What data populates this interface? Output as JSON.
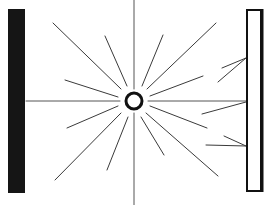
{
  "diagram": {
    "title": "",
    "colors": {
      "background": "#ffffff",
      "ray": "#3a3a3a",
      "axis": "#555555",
      "wall": "#151515",
      "panel_fill": "#ffffff",
      "panel_stroke": "#111111",
      "source": "#111111"
    },
    "source": {
      "cx": 134,
      "cy": 101,
      "r": 8
    },
    "left_wall": {
      "x": 8,
      "y": 9,
      "width": 17,
      "height": 184
    },
    "right_panel": {
      "x": 247,
      "y": 10,
      "width": 15,
      "height": 181
    },
    "axes": [
      {
        "x1": 26,
        "y1": 101,
        "x2": 120,
        "y2": 101
      },
      {
        "x1": 148,
        "y1": 101,
        "x2": 247,
        "y2": 101
      },
      {
        "x1": 134,
        "y1": 0,
        "x2": 134,
        "y2": 89
      },
      {
        "x1": 134,
        "y1": 113,
        "x2": 134,
        "y2": 205
      }
    ],
    "rays": [
      {
        "x1": 121,
        "y1": 89,
        "x2": 53,
        "y2": 23
      },
      {
        "x1": 127,
        "y1": 86,
        "x2": 105,
        "y2": 36
      },
      {
        "x1": 118,
        "y1": 97,
        "x2": 65,
        "y2": 80
      },
      {
        "x1": 142,
        "y1": 86,
        "x2": 163,
        "y2": 35
      },
      {
        "x1": 147,
        "y1": 89,
        "x2": 216,
        "y2": 23
      },
      {
        "x1": 150,
        "y1": 96,
        "x2": 203,
        "y2": 76
      },
      {
        "x1": 118,
        "y1": 106,
        "x2": 67,
        "y2": 128
      },
      {
        "x1": 121,
        "y1": 113,
        "x2": 55,
        "y2": 180
      },
      {
        "x1": 128,
        "y1": 117,
        "x2": 107,
        "y2": 170
      },
      {
        "x1": 141,
        "y1": 117,
        "x2": 164,
        "y2": 155
      },
      {
        "x1": 146,
        "y1": 113,
        "x2": 218,
        "y2": 176
      },
      {
        "x1": 150,
        "y1": 106,
        "x2": 207,
        "y2": 128
      },
      {
        "x1": 202,
        "y1": 114,
        "x2": 246,
        "y2": 102
      }
    ],
    "reflected_rays": [
      {
        "x1": 246,
        "y1": 58,
        "x2": 222,
        "y2": 68
      },
      {
        "x1": 246,
        "y1": 58,
        "x2": 218,
        "y2": 82
      },
      {
        "x1": 246,
        "y1": 146,
        "x2": 206,
        "y2": 145
      },
      {
        "x1": 246,
        "y1": 146,
        "x2": 224,
        "y2": 136
      }
    ]
  }
}
